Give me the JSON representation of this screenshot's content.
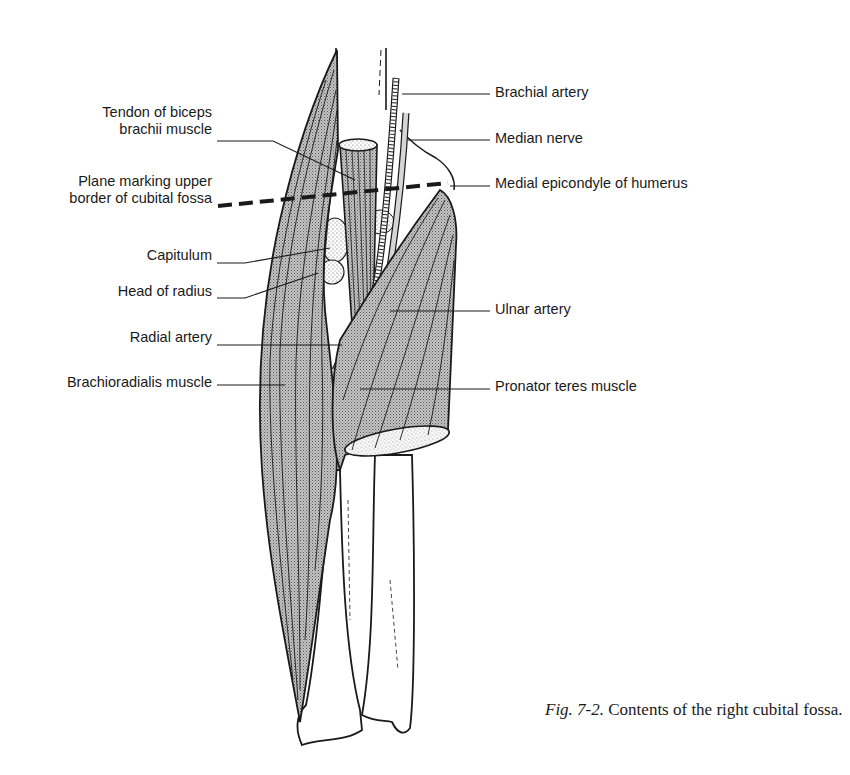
{
  "figure": {
    "caption_number": "Fig. 7-2.",
    "caption_text": "Contents of the right cubital fossa."
  },
  "labels_left": [
    {
      "id": "tendon-biceps",
      "line1": "Tendon of biceps",
      "line2": "brachii muscle"
    },
    {
      "id": "plane-upper-border",
      "line1": "Plane marking upper",
      "line2": "border of cubital fossa"
    },
    {
      "id": "capitulum",
      "text": "Capitulum"
    },
    {
      "id": "head-of-radius",
      "text": "Head of radius"
    },
    {
      "id": "radial-artery",
      "text": "Radial artery"
    },
    {
      "id": "brachioradialis",
      "text": "Brachioradialis muscle"
    }
  ],
  "labels_right": [
    {
      "id": "brachial-artery",
      "text": "Brachial artery"
    },
    {
      "id": "median-nerve",
      "text": "Median nerve"
    },
    {
      "id": "medial-epicondyle",
      "text": "Medial epicondyle of humerus"
    },
    {
      "id": "ulnar-artery",
      "text": "Ulnar artery"
    },
    {
      "id": "pronator-teres",
      "text": "Pronator teres muscle"
    }
  ],
  "colors": {
    "ink": "#1a1a1a",
    "muscle_fill": "#a9a9a9",
    "background": "#ffffff"
  }
}
